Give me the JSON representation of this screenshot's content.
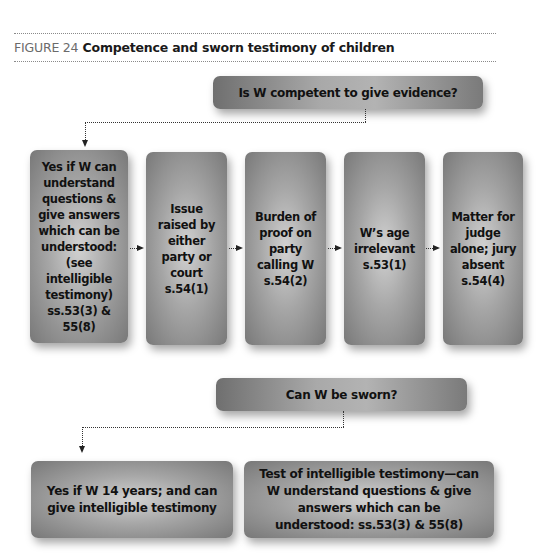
{
  "figure": {
    "number_label": "FIGURE 24",
    "title": "Competence and sworn testimony of children"
  },
  "competence": {
    "question": "Is W competent to give evidence?",
    "steps": [
      {
        "text": "Yes if W can understand questions & give answers which can be understood: (see intelligible testimony) ss.53(3) & 55(8)"
      },
      {
        "text": "Issue raised by either party or court s.54(1)"
      },
      {
        "text": "Burden of proof on party calling W s.54(2)"
      },
      {
        "text": "W’s age irrelevant s.53(1)"
      },
      {
        "text": "Matter for judge alone; jury absent s.54(4)"
      }
    ]
  },
  "sworn": {
    "question": "Can W be sworn?",
    "answers": [
      {
        "text": "Yes if W 14 years; and can give intelligible testimony"
      },
      {
        "text": "Test of intelligible testimony—can W understand questions & give answers which can be understood: ss.53(3) & 55(8)"
      }
    ]
  },
  "colors": {
    "box_dark": "#787878",
    "box_light": "#d2d2d2",
    "rule": "#8a8a8a",
    "figure_number": "#6b6b6b",
    "text": "#111111"
  }
}
